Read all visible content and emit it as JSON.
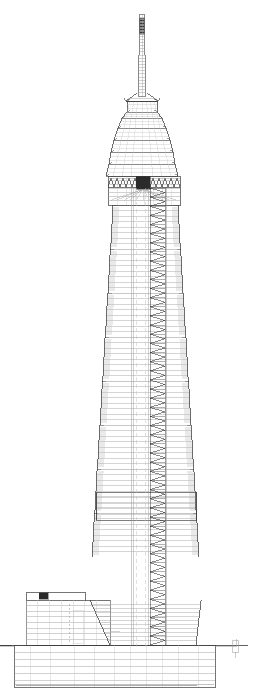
{
  "document": {
    "type": "architectural-section-elevation",
    "subject": "supertall-tower",
    "background_color": "#ffffff",
    "line_color": "#3a3a3a",
    "light_line_color": "#9a9a9a",
    "hair_line_color": "#c2c2c2",
    "fill_dark_color": "#2b2b2b",
    "width_px": 253,
    "height_px": 693
  },
  "chart_data": {
    "type": "line",
    "xlabel": "",
    "ylabel": "",
    "grid": false,
    "legend": "none",
    "xlim": [
      0,
      253
    ],
    "ylim": [
      693,
      0
    ],
    "categories": [
      "spire-tip",
      "spire-mast",
      "pagoda-finial",
      "pagoda-crown",
      "crown-cornice",
      "shaft-segment-8",
      "shaft-segment-7",
      "shaft-segment-6",
      "shaft-segment-5",
      "shaft-segment-4",
      "shaft-segment-3",
      "shaft-segment-2",
      "shaft-segment-1",
      "podium",
      "basement"
    ],
    "values": [
      14,
      78,
      96,
      118,
      176,
      205,
      248,
      292,
      336,
      380,
      424,
      468,
      512,
      590,
      652
    ],
    "series": [
      {
        "name": "outline-left-x",
        "values": [
          139,
          137,
          128,
          127,
          108,
          113,
          111,
          109,
          107,
          105,
          103,
          101,
          99,
          26,
          14
        ]
      },
      {
        "name": "outline-right-x",
        "values": [
          145,
          147,
          156,
          157,
          180,
          178,
          180,
          182,
          184,
          186,
          188,
          190,
          192,
          205,
          215
        ]
      }
    ]
  },
  "structure": {
    "title": "Tower Section",
    "ground_line": {
      "y": 645,
      "x_start": 0,
      "x_end": 248,
      "label": "ground-level"
    },
    "spire": {
      "label": "antenna-spire",
      "top_y": 14,
      "bottom_y": 96,
      "width_top": 4,
      "width_bottom": 8,
      "center_x": 142,
      "rung_count": 26,
      "dark_band": {
        "y_start": 18,
        "y_end": 34
      }
    },
    "finial": {
      "label": "spire-base-flare",
      "y_top": 93,
      "y_bottom": 101,
      "half_width_top": 5,
      "half_width_bottom": 16
    },
    "pagoda_crown": {
      "label": "pagoda-crown",
      "y_top": 101,
      "y_bottom": 176,
      "tiers": [
        {
          "y": 101,
          "half_width": 15
        },
        {
          "y": 112,
          "half_width": 15
        },
        {
          "y": 118,
          "half_width": 20
        },
        {
          "y": 128,
          "half_width": 24
        },
        {
          "y": 140,
          "half_width": 28
        },
        {
          "y": 152,
          "half_width": 31
        },
        {
          "y": 164,
          "half_width": 33
        },
        {
          "y": 176,
          "half_width": 36
        }
      ],
      "floor_line_count": 18
    },
    "cornice": {
      "label": "zigzag-cornice",
      "y": 178,
      "height": 9,
      "x_left": 108,
      "x_right": 180,
      "tooth_count": 12,
      "dark_block": {
        "x": 136,
        "y": 176,
        "w": 14,
        "h": 13
      }
    },
    "crown_block": {
      "label": "crown-block",
      "y_top": 176,
      "y_bottom": 205,
      "x_left": 108,
      "x_right": 180,
      "floor_line_count": 6
    },
    "shaft": {
      "label": "main-shaft",
      "y_top": 205,
      "y_bottom": 600,
      "segment_count": 8,
      "segment_height": 44,
      "taper_step_px": 2,
      "floor_lines_per_segment": 8,
      "top_left_x": 113,
      "top_right_x": 178,
      "bottom_left_x": 92,
      "bottom_right_x": 199
    },
    "outrigger": {
      "label": "outrigger-ledge",
      "y_top": 492,
      "y_bottom": 520,
      "x_left": 96,
      "x_right": 196,
      "extension": 10
    },
    "core": {
      "label": "service-core",
      "x_left": 131,
      "x_right": 166,
      "y_top": 188,
      "y_bottom": 645,
      "elevator_shaft": {
        "x_left": 133,
        "x_right": 148
      },
      "stair_shaft": {
        "x_left": 150,
        "x_right": 165,
        "tread_count": 100
      }
    },
    "podium": {
      "label": "low-rise-podium",
      "x_left": 26,
      "x_right": 110,
      "y_top": 592,
      "y_bottom": 645,
      "floor_line_count": 7,
      "roof_parapet": {
        "x_left": 26,
        "x_right": 85,
        "y": 592,
        "h": 8
      },
      "mechanical_block": {
        "x": 39,
        "y": 592,
        "w": 9,
        "h": 8
      }
    },
    "basement": {
      "label": "basement-levels",
      "x_left": 14,
      "x_right": 215,
      "y_top": 645,
      "y_bottom": 687,
      "level_count": 5,
      "slab_line_count": 5
    },
    "site_marker": {
      "label": "site-boundary-marker",
      "x": 232,
      "y": 640,
      "w": 6,
      "h": 12
    }
  },
  "labels": {
    "drawing_caption": "",
    "scale_note": "",
    "sheet_number": ""
  }
}
